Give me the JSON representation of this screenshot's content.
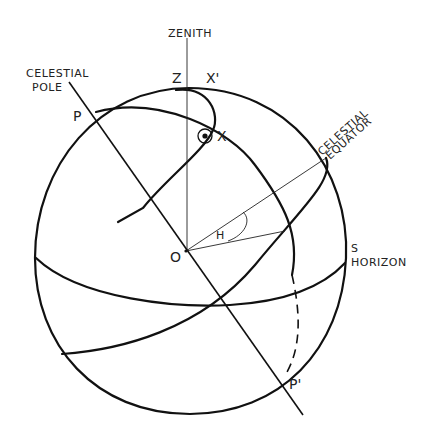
{
  "figure": {
    "type": "celestial-sphere-diagram",
    "labels": {
      "zenith": "ZENITH",
      "celestial_pole_line1": "CELESTIAL",
      "celestial_pole_line2": "POLE",
      "celestial_equator_line1": "CELESTIAL",
      "celestial_equator_line2": "EQUATOR",
      "south": "S",
      "horizon": "HORIZON",
      "z": "Z",
      "x_prime": "X'",
      "x": "X",
      "p": "P",
      "p_prime": "P'",
      "o": "O",
      "h": "H"
    },
    "colors": {
      "ink": "#111111",
      "background": "#ffffff"
    }
  }
}
